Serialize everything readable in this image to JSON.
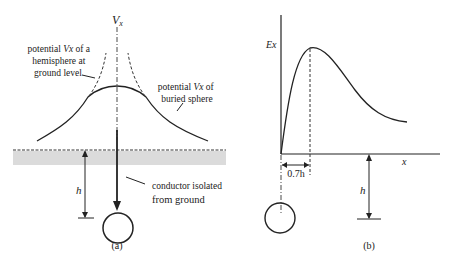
{
  "figure": {
    "panel_a": {
      "caption": "(a)",
      "axis_label": "V",
      "axis_label_sub": "x",
      "annotation_hemisphere": {
        "line1": "potential ",
        "var": "Vx",
        "line1_tail": " of a",
        "line2": "hemisphere at",
        "line3": "ground level"
      },
      "annotation_sphere": {
        "line1": "potential ",
        "var": "Vx",
        "line1_tail": " of",
        "line2": "buried sphere"
      },
      "annotation_conductor": {
        "line1": "conductor isolated",
        "line2": "from ground"
      },
      "depth_label": "h"
    },
    "panel_b": {
      "caption": "(b)",
      "y_axis_label": "Ex",
      "x_axis_label": "x",
      "peak_offset_label": "0.7h",
      "depth_label": "h"
    }
  },
  "colors": {
    "line": "#222222",
    "ground": "#9a9a9a",
    "background": "#ffffff"
  }
}
